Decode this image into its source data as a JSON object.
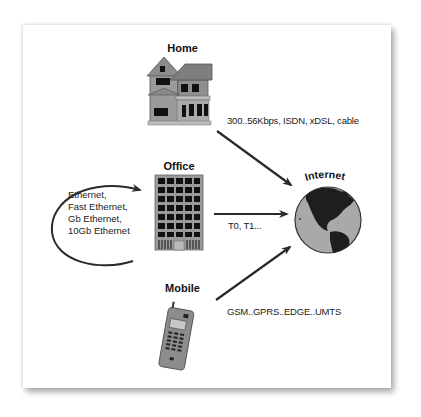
{
  "diagram": {
    "nodes": {
      "home": {
        "label": "Home",
        "icon": "house-icon"
      },
      "office": {
        "label": "Office",
        "icon": "office-building-icon"
      },
      "mobile": {
        "label": "Mobile",
        "icon": "mobile-phone-icon"
      },
      "internet": {
        "label": "Internet",
        "icon": "globe-icon"
      }
    },
    "links": {
      "home_internet": "300..56Kbps, ISDN, xDSL, cable",
      "office_internet": "T0, T1...",
      "mobile_internet": "GSM..GPRS..EDGE..UMTS"
    },
    "office_lan": {
      "lines": [
        "Ethernet,",
        "Fast Ethernet,",
        "Gb Ethernet,",
        "10Gb Ethernet"
      ]
    },
    "colors": {
      "arrow": "#2a2a2a",
      "building": "#8a8a8a",
      "globe_ocean": "#a9a9a9",
      "globe_land": "#1e1e1e"
    }
  }
}
